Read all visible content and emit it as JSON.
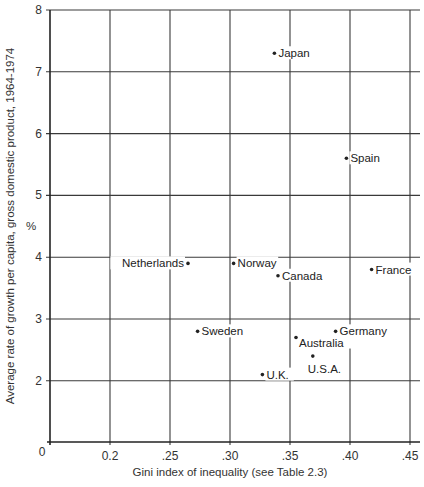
{
  "chart_data": {
    "type": "scatter",
    "title": "",
    "xlabel": "Gini index of inequality (see Table 2.3)",
    "ylabel": "Average rate of growth per capita, gross domestic product, 1964-1974",
    "ylabel_unit": "%",
    "x_ticks": [
      {
        "value": 0.2,
        "label": "0.2"
      },
      {
        "value": 0.25,
        "label": ".25"
      },
      {
        "value": 0.3,
        "label": ".30"
      },
      {
        "value": 0.35,
        "label": ".35"
      },
      {
        "value": 0.4,
        "label": ".40"
      },
      {
        "value": 0.45,
        "label": ".45"
      }
    ],
    "x_origin_label": "0",
    "y_ticks": [
      {
        "value": 2,
        "label": "2"
      },
      {
        "value": 3,
        "label": "3"
      },
      {
        "value": 4,
        "label": "4"
      },
      {
        "value": 5,
        "label": "5"
      },
      {
        "value": 6,
        "label": "6"
      },
      {
        "value": 7,
        "label": "7"
      },
      {
        "value": 8,
        "label": "8"
      }
    ],
    "y_origin_label": "0",
    "xlim": [
      0.15,
      0.46
    ],
    "ylim": [
      0,
      8
    ],
    "axis_break": "both axes start at 0 with a break before first labeled tick",
    "grid": true,
    "legend": null,
    "points": [
      {
        "label": "Japan",
        "x": 0.337,
        "y": 7.3,
        "label_side": "right"
      },
      {
        "label": "Spain",
        "x": 0.397,
        "y": 5.6,
        "label_side": "right"
      },
      {
        "label": "Netherlands",
        "x": 0.265,
        "y": 3.9,
        "label_side": "left"
      },
      {
        "label": "Norway",
        "x": 0.303,
        "y": 3.9,
        "label_side": "right"
      },
      {
        "label": "Canada",
        "x": 0.34,
        "y": 3.7,
        "label_side": "right"
      },
      {
        "label": "France",
        "x": 0.418,
        "y": 3.8,
        "label_side": "right"
      },
      {
        "label": "Sweden",
        "x": 0.273,
        "y": 2.8,
        "label_side": "right"
      },
      {
        "label": "Germany",
        "x": 0.388,
        "y": 2.8,
        "label_side": "right"
      },
      {
        "label": "Australia",
        "x": 0.355,
        "y": 2.7,
        "label_side": "right-below"
      },
      {
        "label": "U.S.A.",
        "x": 0.369,
        "y": 2.4,
        "label_side": "below"
      },
      {
        "label": "U.K.",
        "x": 0.327,
        "y": 2.1,
        "label_side": "right"
      }
    ]
  }
}
